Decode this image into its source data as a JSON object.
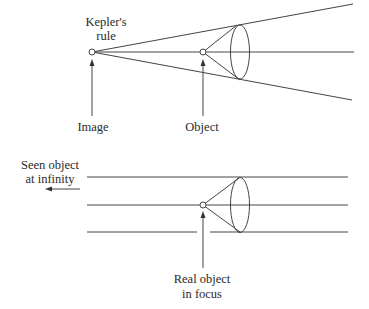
{
  "top_diagram": {
    "labels": {
      "kepler_line1": "Kepler's",
      "kepler_line2": "rule",
      "image": "Image",
      "object": "Object"
    }
  },
  "bottom_diagram": {
    "labels": {
      "seen_line1": "Seen object",
      "seen_line2": "at infinity",
      "real_line1": "Real object",
      "real_line2": "in focus"
    }
  },
  "colors": {
    "line": "#444444",
    "text": "#2a2a2a",
    "background": "#ffffff"
  }
}
